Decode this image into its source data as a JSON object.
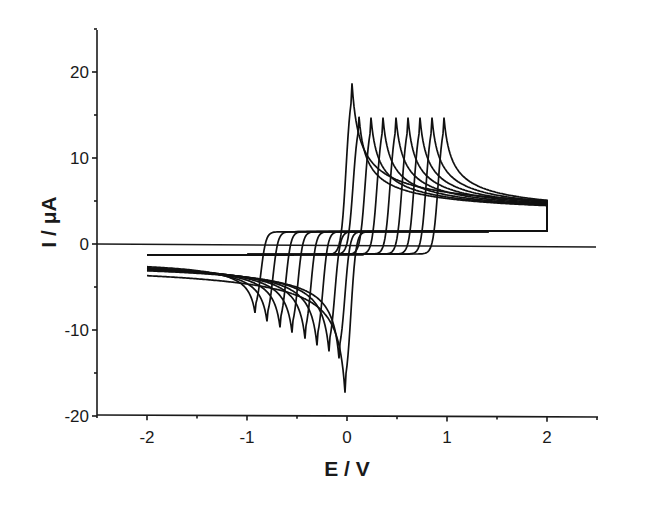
{
  "chart_data": {
    "type": "line",
    "title": "",
    "xlabel": "E / V",
    "ylabel": "I / μA",
    "xlim": [
      -2.5,
      2.5
    ],
    "ylim": [
      -20,
      25
    ],
    "xticks": [
      -2,
      -1,
      0,
      1,
      2
    ],
    "xtick_labels": [
      "-2",
      "-1",
      "0",
      "1",
      "2"
    ],
    "yticks": [
      -20,
      -10,
      0,
      10,
      20
    ],
    "ytick_labels": [
      "-20",
      "-10",
      "0",
      "10",
      "20"
    ],
    "grid": false,
    "legend": null,
    "zero_line": true,
    "series": [
      {
        "name": "curve 1",
        "anodic_peak": {
          "E": 0.05,
          "I": 18.7
        },
        "cathodic_peak": {
          "E": -0.02,
          "I": -17.3
        }
      },
      {
        "name": "curve 2",
        "anodic_peak": {
          "E": 0.12,
          "I": 14.8
        },
        "cathodic_peak": {
          "E": -0.08,
          "I": -13.3
        }
      },
      {
        "name": "curve 3",
        "anodic_peak": {
          "E": 0.24,
          "I": 14.7
        },
        "cathodic_peak": {
          "E": -0.18,
          "I": -12.5
        }
      },
      {
        "name": "curve 4",
        "anodic_peak": {
          "E": 0.36,
          "I": 14.7
        },
        "cathodic_peak": {
          "E": -0.3,
          "I": -11.8
        }
      },
      {
        "name": "curve 5",
        "anodic_peak": {
          "E": 0.49,
          "I": 14.7
        },
        "cathodic_peak": {
          "E": -0.42,
          "I": -11.0
        }
      },
      {
        "name": "curve 6",
        "anodic_peak": {
          "E": 0.61,
          "I": 14.7
        },
        "cathodic_peak": {
          "E": -0.55,
          "I": -10.3
        }
      },
      {
        "name": "curve 7",
        "anodic_peak": {
          "E": 0.73,
          "I": 14.7
        },
        "cathodic_peak": {
          "E": -0.67,
          "I": -9.7
        }
      },
      {
        "name": "curve 8",
        "anodic_peak": {
          "E": 0.85,
          "I": 14.7
        },
        "cathodic_peak": {
          "E": -0.8,
          "I": -9.0
        }
      },
      {
        "name": "curve 9",
        "anodic_peak": {
          "E": 0.97,
          "I": 14.7
        },
        "cathodic_peak": {
          "E": -0.92,
          "I": -8.0
        }
      }
    ],
    "endpoints": {
      "start": {
        "E": -2.0,
        "I": -1.3
      },
      "end_forward": {
        "E": 2.0,
        "I": 3.0
      },
      "end_reverse": {
        "E": 2.0,
        "I": 2.5
      }
    }
  }
}
